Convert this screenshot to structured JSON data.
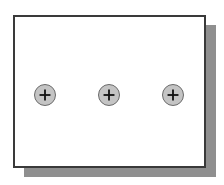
{
  "diagram": {
    "panel": {
      "shadow_color": "#8f8f8f",
      "border_color": "#3a3a3a",
      "fill_color": "#ffffff"
    },
    "fasteners": [
      {
        "icon": "plus-screw-icon",
        "cx": 45,
        "cy": 95
      },
      {
        "icon": "plus-screw-icon",
        "cx": 109,
        "cy": 95
      },
      {
        "icon": "plus-screw-icon",
        "cx": 173,
        "cy": 95
      }
    ],
    "fastener_color": "#c4c4c4"
  }
}
